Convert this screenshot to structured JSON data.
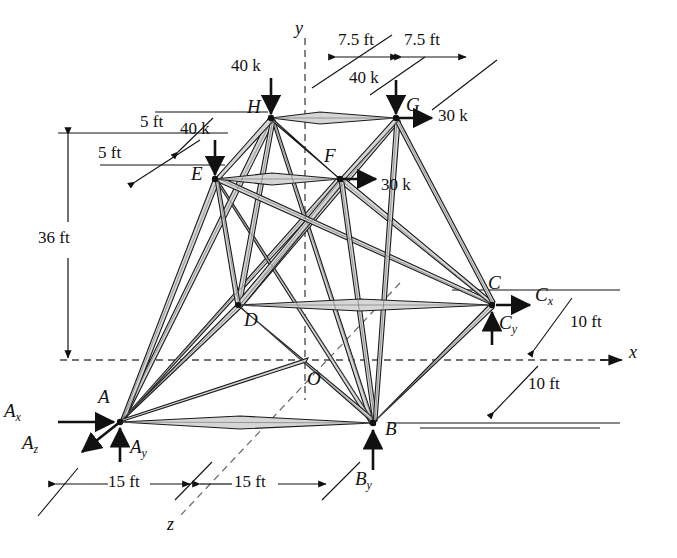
{
  "figure": {
    "type": "space-truss-free-body-diagram",
    "title": "",
    "joints": [
      {
        "id": "A",
        "label": "A",
        "x": 120,
        "y": 422,
        "label_dx": -22,
        "label_dy": -24
      },
      {
        "id": "B",
        "label": "B",
        "x": 373,
        "y": 423,
        "label_dx": 12,
        "label_dy": -2
      },
      {
        "id": "C",
        "label": "C",
        "x": 492,
        "y": 305,
        "label_dx": -4,
        "label_dy": -30
      },
      {
        "id": "D",
        "label": "D",
        "x": 238,
        "y": 305,
        "label_dx": 6,
        "label_dy": 6
      },
      {
        "id": "E",
        "label": "E",
        "x": 215,
        "y": 179,
        "label_dx": -24,
        "label_dy": -14
      },
      {
        "id": "F",
        "label": "F",
        "x": 340,
        "y": 179,
        "label_dx": -16,
        "label_dy": -32
      },
      {
        "id": "G",
        "label": "G",
        "x": 396,
        "y": 118,
        "label_dx": 10,
        "label_dy": -22
      },
      {
        "id": "H",
        "label": "H",
        "x": 271,
        "y": 118,
        "label_dx": -24,
        "label_dy": -20
      },
      {
        "id": "O",
        "label": "O",
        "x": 305,
        "y": 360,
        "label_dx": 2,
        "label_dy": 10
      }
    ],
    "axes": [
      {
        "name": "x",
        "label": "x",
        "x": 634,
        "y": 352
      },
      {
        "name": "y",
        "label": "y",
        "x": 299,
        "y": 28
      },
      {
        "name": "z",
        "label": "z",
        "x": 171,
        "y": 524
      }
    ],
    "loads": [
      {
        "name": "load-H",
        "label": "40 k",
        "x": 233,
        "y": 68
      },
      {
        "name": "load-E",
        "label": "40 k",
        "x": 182,
        "y": 131
      },
      {
        "name": "load-G",
        "label": "40 k",
        "x": 352,
        "y": 80
      },
      {
        "name": "load-G-horizontal",
        "label": "30 k",
        "x": 440,
        "y": 105
      },
      {
        "name": "load-F-horizontal",
        "label": "30 k",
        "x": 382,
        "y": 174
      }
    ],
    "reactions": [
      {
        "name": "reaction-Ax",
        "base": "A",
        "sub": "x",
        "x": 6,
        "y": 412
      },
      {
        "name": "reaction-Az",
        "base": "A",
        "sub": "z",
        "x": 20,
        "y": 443
      },
      {
        "name": "reaction-Ay",
        "base": "A",
        "sub": "y",
        "x": 130,
        "y": 445
      },
      {
        "name": "reaction-By",
        "base": "B",
        "sub": "y",
        "x": 360,
        "y": 478
      },
      {
        "name": "reaction-Cx",
        "base": "C",
        "sub": "x",
        "x": 528,
        "y": 293
      },
      {
        "name": "reaction-Cy",
        "base": "C",
        "sub": "y",
        "x": 496,
        "y": 320
      }
    ],
    "dimensions": [
      {
        "name": "dim-7p5-left",
        "label": "7.5 ft",
        "x": 360,
        "y": 30
      },
      {
        "name": "dim-7p5-right",
        "label": "7.5 ft",
        "x": 428,
        "y": 30
      },
      {
        "name": "dim-5ft-upper",
        "label": "5 ft",
        "x": 145,
        "y": 122
      },
      {
        "name": "dim-5ft-lower",
        "label": "5 ft",
        "x": 103,
        "y": 150
      },
      {
        "name": "dim-36ft",
        "label": "36 ft",
        "x": 45,
        "y": 240
      },
      {
        "name": "dim-10ft-upper",
        "label": "10 ft",
        "x": 572,
        "y": 318
      },
      {
        "name": "dim-10ft-lower",
        "label": "10 ft",
        "x": 530,
        "y": 382
      },
      {
        "name": "dim-15ft-left",
        "label": "15 ft",
        "x": 98,
        "y": 494
      },
      {
        "name": "dim-15ft-right",
        "label": "15 ft",
        "x": 240,
        "y": 494
      }
    ],
    "colors": {
      "member_fill": "#d4d4d4",
      "member_stroke": "#1a1a1a",
      "line": "#111111",
      "dashed": "#333333",
      "guide": "#555555"
    },
    "members": [
      "H-G",
      "E-F",
      "A-B",
      "D-C",
      "A-E",
      "A-H",
      "A-D",
      "A-F",
      "A-O",
      "B-F",
      "B-G",
      "B-C",
      "B-D",
      "C-F",
      "C-G",
      "C-E",
      "E-H",
      "E-D",
      "F-G",
      "F-H",
      "F-D",
      "H-D",
      "H-B",
      "E-B",
      "G-D"
    ]
  }
}
